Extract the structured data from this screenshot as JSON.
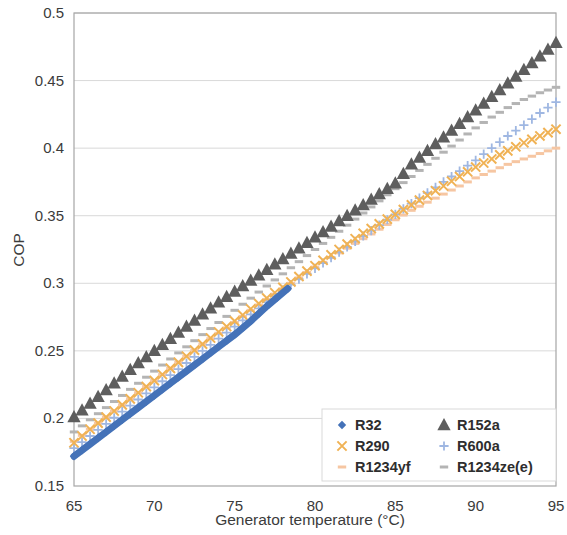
{
  "chart_data": {
    "type": "line",
    "title": "",
    "xlabel": "Generator temperature (°C)",
    "ylabel": "COP",
    "xlim": [
      65,
      95
    ],
    "ylim": [
      0.15,
      0.5
    ],
    "xticks": [
      65,
      70,
      75,
      80,
      85,
      90,
      95
    ],
    "yticks": [
      0.15,
      0.2,
      0.25,
      0.3,
      0.35,
      0.4,
      0.45,
      0.5
    ],
    "xtick_labels": [
      "65",
      "70",
      "75",
      "80",
      "85",
      "90",
      "95"
    ],
    "ytick_labels": [
      "0.15",
      "0.2",
      "0.25",
      "0.3",
      "0.35",
      "0.4",
      "0.45",
      "0.5"
    ],
    "grid": "horizontal",
    "legend_position": "lower-right-inside",
    "series": [
      {
        "name": "R32",
        "color": "#4472B8",
        "marker": "diamond",
        "x": [
          65,
          66,
          67,
          68,
          69,
          70,
          71,
          72,
          73,
          74,
          75,
          76,
          77,
          78.3
        ],
        "values": [
          0.172,
          0.181,
          0.19,
          0.199,
          0.208,
          0.217,
          0.226,
          0.235,
          0.244,
          0.253,
          0.262,
          0.272,
          0.283,
          0.296
        ]
      },
      {
        "name": "R152a",
        "color": "#5E5E5E",
        "marker": "triangle",
        "x": [
          65,
          66,
          67,
          68,
          69,
          70,
          71,
          72,
          73,
          74,
          75,
          76,
          77,
          78,
          79,
          80,
          81,
          82,
          83,
          84,
          85,
          86,
          87,
          88,
          89,
          90,
          91,
          92,
          93,
          94,
          95
        ],
        "values": [
          0.201,
          0.211,
          0.221,
          0.231,
          0.241,
          0.25,
          0.259,
          0.268,
          0.277,
          0.286,
          0.294,
          0.302,
          0.31,
          0.318,
          0.326,
          0.334,
          0.342,
          0.35,
          0.358,
          0.366,
          0.374,
          0.388,
          0.398,
          0.408,
          0.418,
          0.428,
          0.438,
          0.448,
          0.458,
          0.468,
          0.478
        ]
      },
      {
        "name": "R290",
        "color": "#F0B254",
        "marker": "cross",
        "x": [
          65,
          66,
          67,
          68,
          69,
          70,
          71,
          72,
          73,
          74,
          75,
          76,
          77,
          78,
          79,
          80,
          81,
          82,
          83,
          84,
          85,
          86,
          87,
          88,
          89,
          90,
          91,
          92,
          93,
          94,
          95
        ],
        "values": [
          0.182,
          0.192,
          0.201,
          0.21,
          0.219,
          0.228,
          0.237,
          0.246,
          0.255,
          0.264,
          0.272,
          0.281,
          0.289,
          0.297,
          0.305,
          0.313,
          0.321,
          0.329,
          0.337,
          0.344,
          0.351,
          0.358,
          0.365,
          0.372,
          0.379,
          0.386,
          0.392,
          0.398,
          0.404,
          0.409,
          0.414
        ]
      },
      {
        "name": "R600a",
        "color": "#9FB7E2",
        "marker": "plus",
        "x": [
          65,
          66,
          67,
          68,
          69,
          70,
          71,
          72,
          73,
          74,
          75,
          76,
          77,
          78,
          79,
          80,
          81,
          82,
          83,
          84,
          85,
          86,
          87,
          88,
          89,
          90,
          91,
          92,
          93,
          94,
          95
        ],
        "values": [
          0.178,
          0.187,
          0.196,
          0.205,
          0.214,
          0.223,
          0.232,
          0.241,
          0.25,
          0.259,
          0.268,
          0.277,
          0.286,
          0.295,
          0.303,
          0.311,
          0.319,
          0.327,
          0.335,
          0.343,
          0.351,
          0.359,
          0.367,
          0.375,
          0.383,
          0.391,
          0.4,
          0.409,
          0.417,
          0.426,
          0.434
        ]
      },
      {
        "name": "R1234yf",
        "color": "#F6C6A2",
        "marker": "dash",
        "x": [
          65,
          66,
          67,
          68,
          69,
          70,
          71,
          72,
          73,
          74,
          75,
          76,
          77,
          78,
          79,
          80,
          81,
          82,
          83,
          84,
          85,
          86,
          87,
          88,
          89,
          90,
          91,
          92,
          93,
          94,
          95
        ],
        "values": [
          0.183,
          0.192,
          0.201,
          0.21,
          0.219,
          0.228,
          0.237,
          0.246,
          0.255,
          0.263,
          0.271,
          0.28,
          0.288,
          0.296,
          0.304,
          0.312,
          0.319,
          0.326,
          0.333,
          0.34,
          0.347,
          0.354,
          0.36,
          0.366,
          0.372,
          0.378,
          0.383,
          0.388,
          0.392,
          0.396,
          0.4
        ]
      },
      {
        "name": "R1234ze(e)",
        "color": "#B4B4B4",
        "marker": "dash",
        "x": [
          65,
          66,
          67,
          68,
          69,
          70,
          71,
          72,
          73,
          74,
          75,
          76,
          77,
          78,
          79,
          80,
          81,
          82,
          83,
          84,
          85,
          86,
          87,
          88,
          89,
          90,
          91,
          92,
          93,
          94,
          95
        ],
        "values": [
          0.19,
          0.199,
          0.208,
          0.217,
          0.226,
          0.235,
          0.244,
          0.253,
          0.262,
          0.271,
          0.28,
          0.289,
          0.298,
          0.307,
          0.316,
          0.325,
          0.334,
          0.343,
          0.352,
          0.361,
          0.37,
          0.379,
          0.388,
          0.397,
          0.406,
          0.415,
          0.423,
          0.43,
          0.436,
          0.441,
          0.445
        ]
      }
    ]
  },
  "legend": {
    "entries": [
      {
        "label": "R32",
        "marker": "diamond",
        "color": "#4472B8"
      },
      {
        "label": "R152a",
        "marker": "triangle",
        "color": "#5E5E5E"
      },
      {
        "label": "R290",
        "marker": "cross",
        "color": "#F0B254"
      },
      {
        "label": "R600a",
        "marker": "plus",
        "color": "#9FB7E2"
      },
      {
        "label": "R1234yf",
        "marker": "dash",
        "color": "#F6C6A2"
      },
      {
        "label": "R1234ze(e)",
        "marker": "dash",
        "color": "#B4B4B4"
      }
    ]
  },
  "style": {
    "plot_border": "#A6A6A6",
    "gridline": "#D9D9D9",
    "text": "#3B3B3B",
    "background": "#FFFFFF"
  }
}
